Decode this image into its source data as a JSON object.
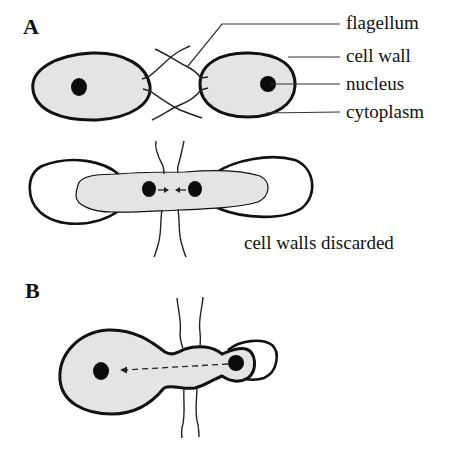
{
  "figure": {
    "panels": [
      {
        "id": "A",
        "letter": "A",
        "stages": [
          {
            "name": "pairing",
            "description": "two walled cells joined by crossed flagella"
          },
          {
            "name": "fusion",
            "caption": "cell walls discarded",
            "description": "protoplasts fuse, nuclei migrate toward each other"
          }
        ]
      },
      {
        "id": "B",
        "letter": "B",
        "description": "small cell's nucleus moves into larger cell along dashed arrow"
      }
    ],
    "labels": {
      "flagellum": "flagellum",
      "cell_wall": "cell wall",
      "nucleus": "nucleus",
      "cytoplasm": "cytoplasm"
    },
    "captions": {
      "walls_discarded": "cell walls discarded"
    },
    "colors": {
      "outline": "#111111",
      "cytoplasm_fill": "#e4e4e4",
      "nucleus": "#0b0b0b",
      "background": "#ffffff"
    }
  }
}
